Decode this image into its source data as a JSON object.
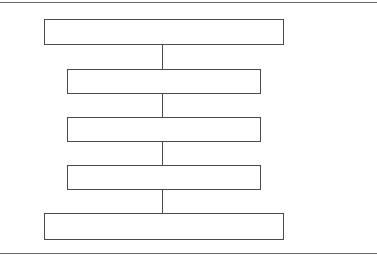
{
  "diagram": {
    "type": "vertical-flow",
    "line_color": "#4a4a4a",
    "rule_color": "#6a6a6a",
    "nodes": [
      {
        "id": "level-1",
        "label": ""
      },
      {
        "id": "level-2",
        "label": ""
      },
      {
        "id": "level-3",
        "label": ""
      },
      {
        "id": "level-4",
        "label": ""
      },
      {
        "id": "level-5",
        "label": ""
      }
    ],
    "edges": [
      {
        "from": "level-1",
        "to": "level-2"
      },
      {
        "from": "level-2",
        "to": "level-3"
      },
      {
        "from": "level-3",
        "to": "level-4"
      },
      {
        "from": "level-4",
        "to": "level-5"
      }
    ]
  }
}
